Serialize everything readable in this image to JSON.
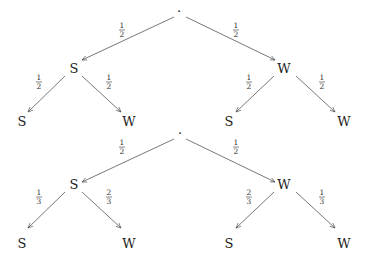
{
  "diagram": {
    "type": "probability-tree",
    "trees": [
      {
        "root": {
          "label": "·"
        },
        "level1": [
          {
            "label": "S",
            "edge_prob": {
              "num": "1",
              "den": "2"
            }
          },
          {
            "label": "W",
            "edge_prob": {
              "num": "1",
              "den": "2"
            }
          }
        ],
        "level2": [
          {
            "parent": "S",
            "label": "S",
            "edge_prob": {
              "num": "1",
              "den": "2"
            }
          },
          {
            "parent": "S",
            "label": "W",
            "edge_prob": {
              "num": "1",
              "den": "2"
            }
          },
          {
            "parent": "W",
            "label": "S",
            "edge_prob": {
              "num": "1",
              "den": "2"
            }
          },
          {
            "parent": "W",
            "label": "W",
            "edge_prob": {
              "num": "1",
              "den": "2"
            }
          }
        ]
      },
      {
        "root": {
          "label": "·"
        },
        "level1": [
          {
            "label": "S",
            "edge_prob": {
              "num": "1",
              "den": "2"
            }
          },
          {
            "label": "W",
            "edge_prob": {
              "num": "1",
              "den": "2"
            }
          }
        ],
        "level2": [
          {
            "parent": "S",
            "label": "S",
            "edge_prob": {
              "num": "1",
              "den": "3"
            }
          },
          {
            "parent": "S",
            "label": "W",
            "edge_prob": {
              "num": "2",
              "den": "3"
            }
          },
          {
            "parent": "W",
            "label": "S",
            "edge_prob": {
              "num": "2",
              "den": "3"
            }
          },
          {
            "parent": "W",
            "label": "W",
            "edge_prob": {
              "num": "1",
              "den": "3"
            }
          }
        ]
      }
    ]
  }
}
